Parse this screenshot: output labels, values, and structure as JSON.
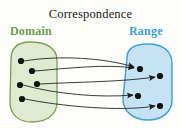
{
  "figure": {
    "title": "Correspondence",
    "type": "mapping-diagram",
    "background_color": "#fdfdfb"
  },
  "domain": {
    "label": "Domain",
    "label_color": "#6d9b4e",
    "fill_color": "#dfead0",
    "stroke_color": "#7ba055",
    "points": [
      {
        "id": "d1",
        "x": 21,
        "y": 61
      },
      {
        "id": "d2",
        "x": 32,
        "y": 71
      },
      {
        "id": "d3",
        "x": 20,
        "y": 85
      },
      {
        "id": "d4",
        "x": 37,
        "y": 84
      },
      {
        "id": "d5",
        "x": 22,
        "y": 99
      }
    ]
  },
  "range": {
    "label": "Range",
    "label_color": "#3b9fd4",
    "fill_color": "#c5e3f5",
    "stroke_color": "#3d9fd6",
    "points": [
      {
        "id": "r1",
        "x": 140,
        "y": 69
      },
      {
        "id": "r2",
        "x": 160,
        "y": 76
      },
      {
        "id": "r3",
        "x": 138,
        "y": 96
      },
      {
        "id": "r4",
        "x": 160,
        "y": 106
      }
    ]
  },
  "arrows": [
    {
      "id": "a1",
      "from": "d1",
      "to": "r1",
      "path": "M 24 61 C 60 55 105 58 134 67"
    },
    {
      "id": "a2",
      "from": "d2",
      "to": "r1",
      "path": "M 35 71 C 70 68 106 64 134 68"
    },
    {
      "id": "a3",
      "from": "d4",
      "to": "r2",
      "path": "M 40 84 C 75 82 122 82 155 77"
    },
    {
      "id": "a4",
      "from": "d3",
      "to": "r3",
      "path": "M 23 85 C 55 94 100 98 133 95"
    },
    {
      "id": "a5",
      "from": "d5",
      "to": "r4",
      "path": "M 25 99 C 60 106 120 112 155 106"
    }
  ],
  "dot_color": "#111111"
}
